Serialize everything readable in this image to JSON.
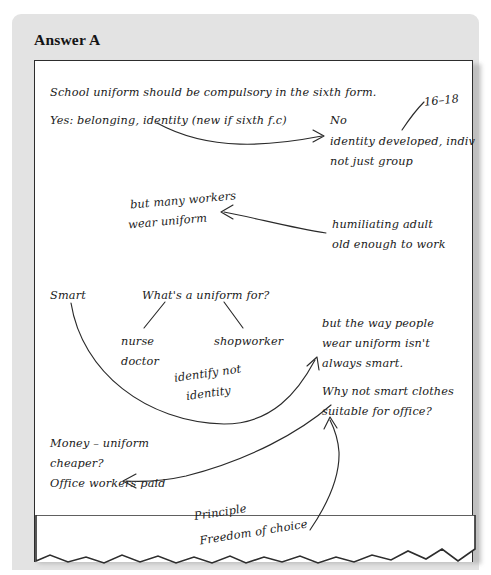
{
  "panel": {
    "title": "Answer A",
    "background_color": "#e3e3e3",
    "paper_color": "#ffffff",
    "ink_color": "#1a1a1a"
  },
  "notes": {
    "thesis": "School uniform should be compulsory in the sixth form.",
    "yes_branch": "Yes: belonging, identity (new if sixth f.c)",
    "no_label": "No",
    "no_point_line1": "identity developed, indiv",
    "no_point_line2": "not just group",
    "age_range": "16–18",
    "counter_line1": "but many workers",
    "counter_line2": "wear uniform",
    "humiliating_line1": "humiliating   adult",
    "humiliating_line2": "old enough to work",
    "smart": "Smart",
    "question": "What's a uniform for?",
    "example_1_line1": "nurse",
    "example_1_line2": "doctor",
    "example_2": "shopworker",
    "identify_line1": "identify not",
    "identify_line2": "identity",
    "way_people_line1": "but the way people",
    "way_people_line2": "wear uniform isn't",
    "way_people_line3": "always smart.",
    "why_not_line1": "Why not smart clothes",
    "why_not_line2": "suitable for office?",
    "money_line1": "Money – uniform",
    "money_line2": "cheaper?",
    "money_line3": "Office workers paid",
    "principle_line1": "Principle",
    "principle_line2": "Freedom of choice"
  }
}
